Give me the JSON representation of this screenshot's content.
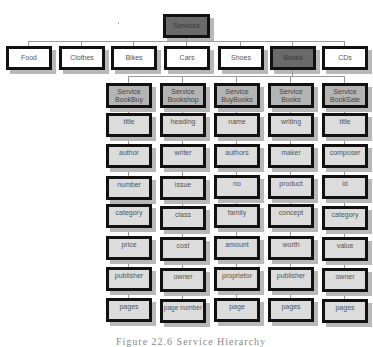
{
  "diagram": {
    "root": "Services",
    "categories": [
      {
        "label": "Food",
        "selected": false
      },
      {
        "label": "Clothes",
        "selected": false
      },
      {
        "label": "Bikes",
        "selected": false
      },
      {
        "label": "Cars",
        "selected": false
      },
      {
        "label": "Shoes",
        "selected": false
      },
      {
        "label": "Books",
        "selected": true
      },
      {
        "label": "CDs",
        "selected": false
      }
    ],
    "services": [
      {
        "line1": "Service",
        "line2": "BookBuy",
        "attributes": [
          "title",
          "author",
          "number",
          "category",
          "price",
          "publisher",
          "pages"
        ]
      },
      {
        "line1": "Service",
        "line2": "Bookshop",
        "attributes": [
          "heading",
          "writer",
          "issue",
          "class",
          "cost",
          "owner",
          "page number"
        ]
      },
      {
        "line1": "Service",
        "line2": "BuyBooks",
        "attributes": [
          "name",
          "authors",
          "no",
          "family",
          "amount",
          "proprietor",
          "page"
        ]
      },
      {
        "line1": "Service",
        "line2": "Books",
        "attributes": [
          "writing",
          "maker",
          "product",
          "concept",
          "worth",
          "publisher",
          "pages"
        ]
      },
      {
        "line1": "Service",
        "line2": "BookSale",
        "attributes": [
          "title",
          "composer",
          "id",
          "category",
          "value",
          "owner",
          "pages"
        ]
      }
    ],
    "caption": "Figure 22.6 Service Hierarchy"
  }
}
